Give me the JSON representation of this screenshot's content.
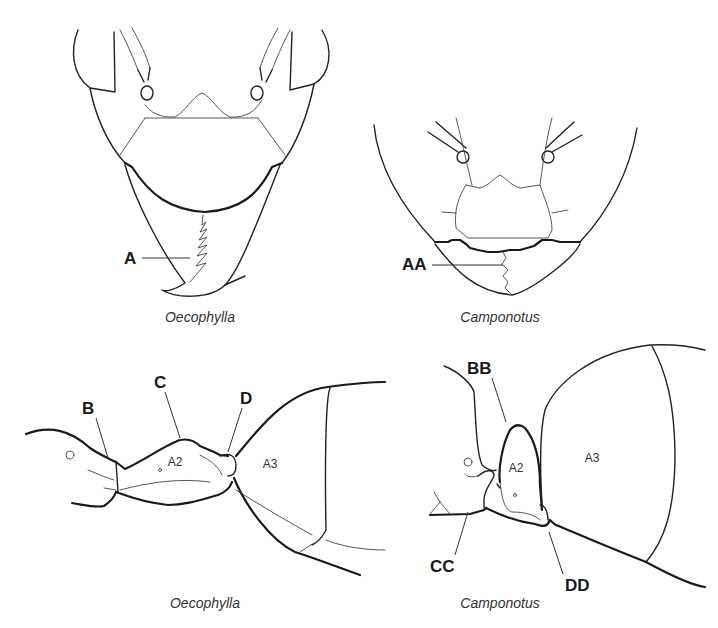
{
  "figure": {
    "panels": [
      {
        "id": "top-left",
        "view": "head, frontal view",
        "caption": "Oecophylla",
        "labels": [
          {
            "text": "A",
            "target": "mandible masticatory margin (long, many teeth)"
          }
        ]
      },
      {
        "id": "top-right",
        "view": "head, frontal view",
        "caption": "Camponotus",
        "labels": [
          {
            "text": "AA",
            "target": "mandible masticatory margin (short)"
          }
        ]
      },
      {
        "id": "bottom-left",
        "view": "petiole, lateral view",
        "caption": "Oecophylla",
        "labels": [
          {
            "text": "B",
            "target": "anterior petiole"
          },
          {
            "text": "C",
            "target": "petiole dorsum (low node)"
          },
          {
            "text": "D",
            "target": "petiole-gaster junction"
          }
        ],
        "segments": [
          "A2",
          "A3"
        ]
      },
      {
        "id": "bottom-right",
        "view": "petiole, lateral view",
        "caption": "Camponotus",
        "labels": [
          {
            "text": "BB",
            "target": "anterior petiole"
          },
          {
            "text": "CC",
            "target": "petiole node (scale-like)"
          },
          {
            "text": "DD",
            "target": "petiole-gaster junction"
          }
        ],
        "segments": [
          "A2",
          "A3"
        ]
      }
    ]
  }
}
